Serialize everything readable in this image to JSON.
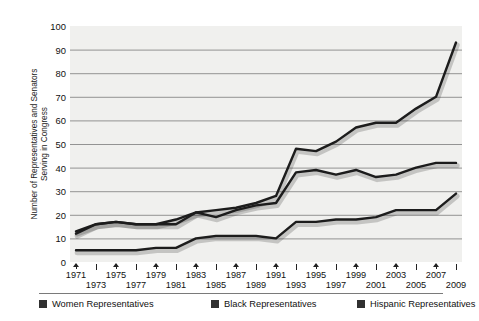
{
  "chart_data": {
    "type": "line",
    "title": "",
    "xlabel": "",
    "ylabel": "Number of Representatives and Senators Serving in Congress",
    "ylim": [
      0,
      100
    ],
    "ytick_step": 10,
    "yticks": [
      0,
      10,
      20,
      30,
      40,
      50,
      60,
      70,
      80,
      90,
      100
    ],
    "grid": true,
    "grid_axis": "y",
    "legend_position": "bottom",
    "x": [
      1971,
      1973,
      1975,
      1977,
      1979,
      1981,
      1983,
      1985,
      1987,
      1989,
      1991,
      1993,
      1995,
      1997,
      1999,
      2001,
      2003,
      2005,
      2007,
      2009
    ],
    "xtick_labels": [
      "1971",
      "1973",
      "1975",
      "1977",
      "1979",
      "1981",
      "1983",
      "1985",
      "1987",
      "1989",
      "1991",
      "1993",
      "1995",
      "1997",
      "1999",
      "2001",
      "2003",
      "2005",
      "2007",
      "2009"
    ],
    "series": [
      {
        "name": "Women Representatives",
        "color": "#1c1c1c",
        "values": [
          12,
          16,
          17,
          16,
          16,
          16,
          21,
          22,
          23,
          25,
          28,
          48,
          47,
          51,
          57,
          59,
          59,
          65,
          70,
          93
        ]
      },
      {
        "name": "Black Representatives",
        "color": "#1c1c1c",
        "values": [
          13,
          16,
          17,
          16,
          16,
          18,
          21,
          19,
          22,
          24,
          25,
          38,
          39,
          37,
          39,
          36,
          37,
          40,
          42,
          42
        ]
      },
      {
        "name": "Hispanic Representatives",
        "color": "#1c1c1c",
        "values": [
          5,
          5,
          5,
          5,
          6,
          6,
          10,
          11,
          11,
          11,
          10,
          17,
          17,
          18,
          18,
          19,
          22,
          22,
          22,
          29
        ]
      }
    ]
  },
  "axis": {
    "y_title": "Number of Representatives and Senators\nServing in Congress"
  },
  "legend": {
    "items": [
      {
        "label": "Women Representatives",
        "swatch_color": "#303030"
      },
      {
        "label": "Black Representatives",
        "swatch_color": "#303030"
      },
      {
        "label": "Hispanic Representatives",
        "swatch_color": "#303030"
      }
    ]
  },
  "style": {
    "plot_background": "#f0f0ee",
    "gridline_color": "#7b7b7b",
    "line_color": "#1c1c1c",
    "text_color": "#111111"
  }
}
